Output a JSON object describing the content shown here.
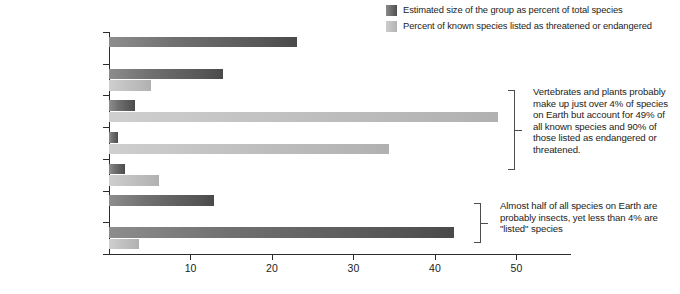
{
  "chart_data": {
    "type": "bar",
    "orientation": "horizontal",
    "title": "",
    "xlabel": "Percentage of the total",
    "ylabel": "",
    "xlim": [
      0,
      56.7
    ],
    "xticks": [
      10,
      20,
      30,
      40,
      50
    ],
    "xticklabels": [
      "10",
      "20",
      "30",
      "40",
      "50"
    ],
    "grid": false,
    "legend_position": "top-right",
    "categories": [
      "Other species",
      "Other invertebrates",
      "Plants",
      "Vertebrates",
      "Mollusks",
      "Fungi",
      "Insects"
    ],
    "series": [
      {
        "name": "Estimated size of the group as percent of total species",
        "color": "#5a5a5a",
        "values": [
          23.1,
          14.0,
          3.2,
          1.1,
          2.0,
          12.9,
          42.3
        ]
      },
      {
        "name": "Percent of known species listed as threatened or endangered",
        "color": "#bdbdbd",
        "values": [
          0,
          5.1,
          47.7,
          34.4,
          6.1,
          0,
          3.7
        ]
      }
    ],
    "annotations": [
      {
        "id": "vertebrates-plants-note",
        "text": "Vertebrates and plants probably make up just over 4% of species on Earth but account for 49% of all known species and 90% of those listed as endangered or threatened.",
        "targets": [
          "Plants",
          "Vertebrates"
        ]
      },
      {
        "id": "insects-note",
        "text": "Almost half of all species on Earth are probably insects, yet less than 4% are \"listed\" species",
        "targets": [
          "Insects"
        ]
      }
    ]
  },
  "legend": {
    "items": [
      {
        "label": "Estimated size of the group as percent of total species",
        "color": "#5a5a5a"
      },
      {
        "label": "Percent of known species listed as threatened or endangered",
        "color": "#bdbdbd"
      }
    ]
  },
  "axis": {
    "x_title": "Percentage of the total",
    "x_tick_labels": [
      "10",
      "20",
      "30",
      "40",
      "50"
    ]
  },
  "categories": [
    {
      "label": "Other species"
    },
    {
      "label": "Other invertebrates"
    },
    {
      "label": "Plants"
    },
    {
      "label": "Vertebrates"
    },
    {
      "label": "Mollusks"
    },
    {
      "label": "Fungi"
    },
    {
      "label": "Insects"
    }
  ],
  "annotations": {
    "upper": "Vertebrates and plants probably make up just over 4% of species on Earth but account for 49% of all known species and 90% of those listed as endangered or threatened.",
    "lower": "Almost half of all species on Earth are probably insects, yet less than 4% are \"listed\" species"
  }
}
